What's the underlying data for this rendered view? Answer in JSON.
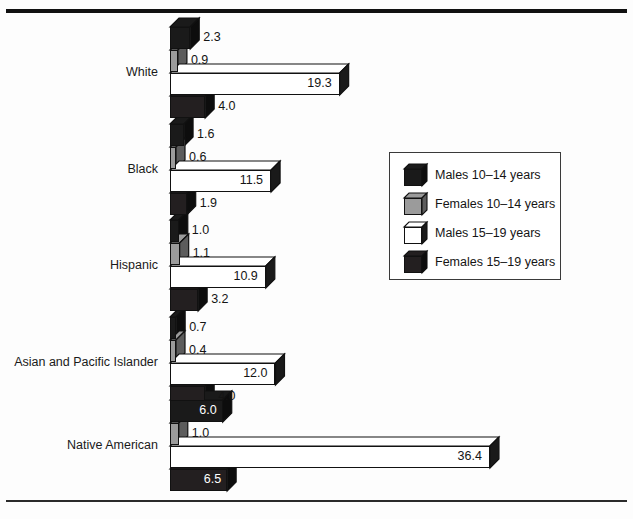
{
  "chart_data": {
    "type": "bar",
    "orientation": "horizontal",
    "title": "",
    "subtitle": "",
    "xlabel": "",
    "ylabel": "",
    "grid": false,
    "xlim": [
      0,
      36.4
    ],
    "categories": [
      "White",
      "Black",
      "Hispanic",
      "Asian and Pacific Islander",
      "Native American"
    ],
    "series": [
      {
        "name": "Males 10–14 years",
        "color": "#1a1a1a",
        "values": [
          2.3,
          1.6,
          1.0,
          0.7,
          6.0
        ]
      },
      {
        "name": "Females 10–14 years",
        "color": "#9b9b9b",
        "values": [
          0.9,
          0.6,
          1.1,
          0.4,
          1.0
        ]
      },
      {
        "name": "Males 15–19 years",
        "color": "#ffffff",
        "values": [
          19.3,
          11.5,
          10.9,
          12.0,
          36.4
        ]
      },
      {
        "name": "Females 15–19 years",
        "color": "#231f20",
        "values": [
          4.0,
          1.9,
          3.2,
          4.0,
          6.5
        ]
      }
    ],
    "value_labels": {
      "White": [
        "2.3",
        "0.9",
        "19.3",
        "4.0"
      ],
      "Black": [
        "1.6",
        "0.6",
        "11.5",
        "1.9"
      ],
      "Hispanic": [
        "1.0",
        "1.1",
        "10.9",
        "3.2"
      ],
      "Asian and Pacific Islander": [
        "0.7",
        "0.4",
        "12.0",
        "4.0"
      ],
      "Native American": [
        "6.0",
        "1.0",
        "36.4",
        "6.5"
      ]
    }
  },
  "legend": {
    "position": "right-middle",
    "items": [
      {
        "label": "Males 10–14 years",
        "swatch": "black-cube-icon"
      },
      {
        "label": "Females 10–14 years",
        "swatch": "gray-cube-icon"
      },
      {
        "label": "Males 15–19 years",
        "swatch": "white-cube-icon"
      },
      {
        "label": "Females 15–19 years",
        "swatch": "dark-cube-icon"
      }
    ]
  },
  "axis": {
    "category_labels": [
      "White",
      "Black",
      "Hispanic",
      "Asian and Pacific Islander",
      "Native American"
    ]
  },
  "colors": {
    "males_10_14": "#1a1a1a",
    "females_10_14": "#9b9b9b",
    "males_15_19": "#ffffff",
    "females_15_19": "#231f20",
    "outline": "#111111",
    "rule": "#111111"
  }
}
